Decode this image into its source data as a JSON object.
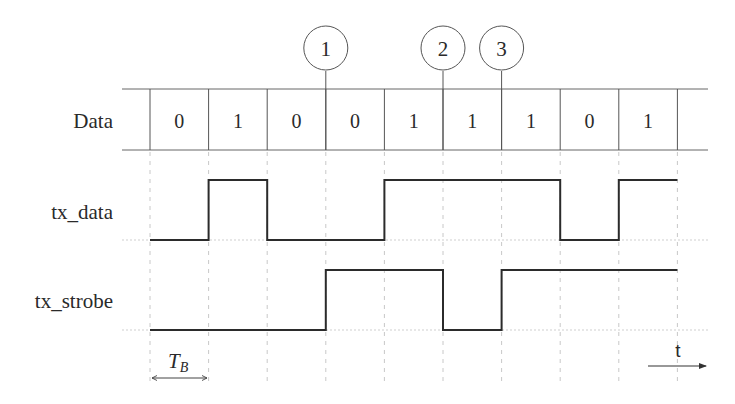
{
  "figure": {
    "type": "timing-diagram"
  },
  "rows": {
    "data_label": "Data",
    "tx_data_label": "tx_data",
    "tx_strobe_label": "tx_strobe"
  },
  "bits": [
    "0",
    "1",
    "0",
    "0",
    "1",
    "1",
    "1",
    "0",
    "1"
  ],
  "signals": {
    "tx_data": [
      0,
      1,
      0,
      0,
      1,
      1,
      1,
      0,
      1
    ],
    "tx_strobe": [
      0,
      0,
      0,
      1,
      1,
      0,
      1,
      1,
      1
    ]
  },
  "markers": [
    {
      "label": "1",
      "at_boundary": 3
    },
    {
      "label": "2",
      "at_boundary": 5
    },
    {
      "label": "3",
      "at_boundary": 6
    }
  ],
  "annotations": {
    "bit_period_label": "T",
    "bit_period_subscript": "B",
    "time_axis_label": "t"
  },
  "colors": {
    "signal": "#2b2b2b",
    "grid": "#c8c8c8",
    "box": "#555555",
    "background": "#ffffff"
  }
}
